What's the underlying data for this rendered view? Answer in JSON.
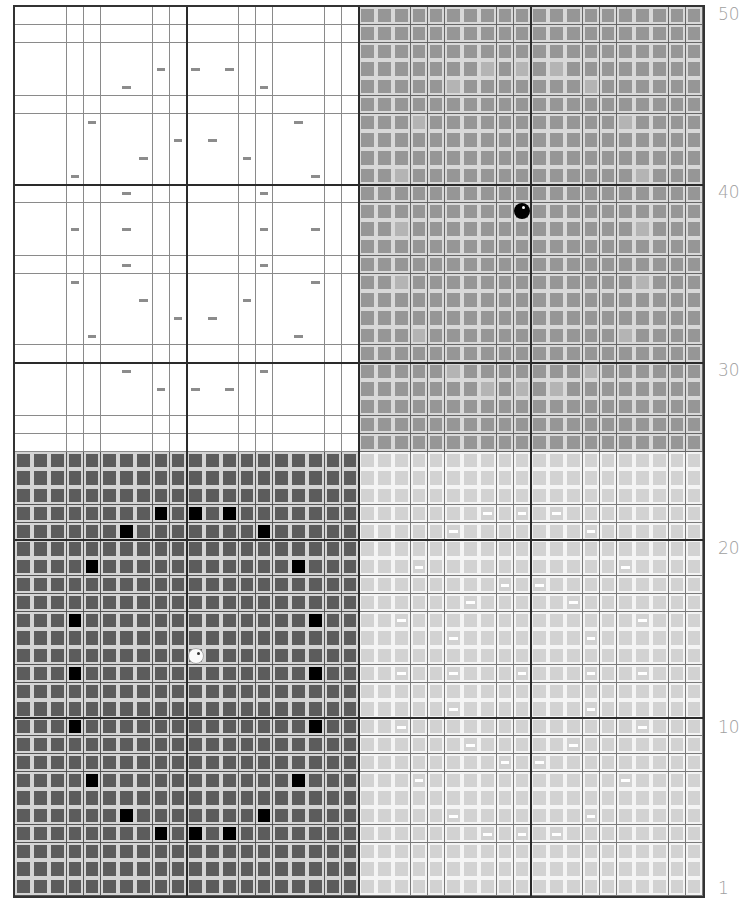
{
  "grid": {
    "columns": 40,
    "rows": 50,
    "major_every": 10,
    "quadrants": [
      {
        "name": "top-left",
        "rows": [
          0,
          24
        ],
        "cols": [
          0,
          19
        ],
        "style": "white"
      },
      {
        "name": "top-right",
        "rows": [
          0,
          24
        ],
        "cols": [
          20,
          39
        ],
        "style": "mid"
      },
      {
        "name": "bottom-left",
        "rows": [
          25,
          49
        ],
        "cols": [
          0,
          19
        ],
        "style": "dark"
      },
      {
        "name": "bottom-right",
        "rows": [
          25,
          49
        ],
        "cols": [
          20,
          39
        ],
        "style": "light"
      }
    ],
    "colors": {
      "white_bg": "#ffffff",
      "mid_tile": "#969696",
      "mid_highlight": "#b4b4b4",
      "dark_tile": "#5c5c5c",
      "light_tile": "#d2d2d2",
      "black_mark": "#000000",
      "gray_dash": "#8c8c8c",
      "white_dash": "#ffffff",
      "major_line": "#2a2a2a",
      "label": "#a0a0a0"
    },
    "gray_dashes": [
      [
        3,
        8
      ],
      [
        3,
        10
      ],
      [
        3,
        12
      ],
      [
        4,
        6
      ],
      [
        4,
        14
      ],
      [
        6,
        4
      ],
      [
        6,
        16
      ],
      [
        7,
        9
      ],
      [
        7,
        11
      ],
      [
        8,
        7
      ],
      [
        8,
        13
      ],
      [
        9,
        3
      ],
      [
        9,
        17
      ],
      [
        10,
        6
      ],
      [
        10,
        14
      ],
      [
        12,
        3
      ],
      [
        12,
        6
      ],
      [
        12,
        14
      ],
      [
        12,
        17
      ],
      [
        14,
        6
      ],
      [
        14,
        14
      ],
      [
        15,
        3
      ],
      [
        15,
        17
      ],
      [
        16,
        7
      ],
      [
        16,
        13
      ],
      [
        17,
        9
      ],
      [
        17,
        11
      ],
      [
        18,
        4
      ],
      [
        18,
        16
      ],
      [
        20,
        6
      ],
      [
        20,
        14
      ],
      [
        21,
        8
      ],
      [
        21,
        10
      ],
      [
        21,
        12
      ]
    ],
    "highlight_cells": [
      [
        3,
        27
      ],
      [
        3,
        29
      ],
      [
        3,
        31
      ],
      [
        4,
        25
      ],
      [
        4,
        33
      ],
      [
        6,
        23
      ],
      [
        6,
        35
      ],
      [
        9,
        22
      ],
      [
        9,
        36
      ],
      [
        12,
        22
      ],
      [
        12,
        36
      ],
      [
        15,
        22
      ],
      [
        15,
        36
      ],
      [
        18,
        23
      ],
      [
        18,
        35
      ],
      [
        20,
        25
      ],
      [
        20,
        33
      ],
      [
        21,
        27
      ],
      [
        21,
        29
      ],
      [
        21,
        31
      ]
    ],
    "black_cells": [
      [
        28,
        8
      ],
      [
        28,
        10
      ],
      [
        28,
        12
      ],
      [
        29,
        6
      ],
      [
        29,
        14
      ],
      [
        31,
        4
      ],
      [
        31,
        16
      ],
      [
        34,
        3
      ],
      [
        34,
        17
      ],
      [
        37,
        3
      ],
      [
        37,
        17
      ],
      [
        40,
        3
      ],
      [
        40,
        17
      ],
      [
        43,
        4
      ],
      [
        43,
        16
      ],
      [
        45,
        6
      ],
      [
        45,
        14
      ],
      [
        46,
        8
      ],
      [
        46,
        10
      ],
      [
        46,
        12
      ]
    ],
    "white_dashes": [
      [
        28,
        27
      ],
      [
        28,
        29
      ],
      [
        28,
        31
      ],
      [
        29,
        25
      ],
      [
        29,
        33
      ],
      [
        31,
        23
      ],
      [
        31,
        35
      ],
      [
        32,
        28
      ],
      [
        32,
        30
      ],
      [
        33,
        26
      ],
      [
        33,
        32
      ],
      [
        34,
        22
      ],
      [
        34,
        36
      ],
      [
        35,
        25
      ],
      [
        35,
        33
      ],
      [
        37,
        22
      ],
      [
        37,
        25
      ],
      [
        37,
        29
      ],
      [
        37,
        33
      ],
      [
        37,
        36
      ],
      [
        39,
        25
      ],
      [
        39,
        33
      ],
      [
        40,
        22
      ],
      [
        40,
        36
      ],
      [
        41,
        26
      ],
      [
        41,
        32
      ],
      [
        42,
        28
      ],
      [
        42,
        30
      ],
      [
        43,
        23
      ],
      [
        43,
        35
      ],
      [
        45,
        25
      ],
      [
        45,
        33
      ],
      [
        46,
        27
      ],
      [
        46,
        29
      ],
      [
        46,
        31
      ]
    ],
    "markers": [
      {
        "name": "black-circle-marker",
        "row": 11,
        "col": 29,
        "color": "black"
      },
      {
        "name": "white-circle-marker",
        "row": 36,
        "col": 10,
        "color": "white"
      }
    ]
  },
  "row_labels": [
    {
      "text": "50",
      "y": 4
    },
    {
      "text": "40",
      "y": 182
    },
    {
      "text": "30",
      "y": 360
    },
    {
      "text": "20",
      "y": 538
    },
    {
      "text": "10",
      "y": 717
    },
    {
      "text": "1",
      "y": 878
    }
  ]
}
